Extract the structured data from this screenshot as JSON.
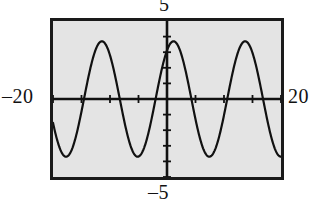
{
  "figure": {
    "kind": "graphing-calculator-screen",
    "screen_background": "#e4e4e4",
    "frame_color": "#1a1a1a",
    "ink_color": "#111111"
  },
  "labels": {
    "top": "5",
    "bottom": "–5",
    "left": "–20",
    "right": "20"
  },
  "chart_data": {
    "type": "line",
    "title": "",
    "subtitle": "",
    "xlabel": "",
    "ylabel": "",
    "grid": false,
    "legend": null,
    "legend_position": "none",
    "xlim": [
      -20,
      20
    ],
    "ylim": [
      -5,
      5
    ],
    "x_tick_labels": [
      "–20",
      "20"
    ],
    "y_tick_labels": [
      "–5",
      "5"
    ],
    "x_ticks": [
      -20,
      -15,
      -10,
      -5,
      0,
      5,
      10,
      15,
      20
    ],
    "y_ticks": [
      -5,
      -4,
      -3,
      -2,
      -1,
      0,
      1,
      2,
      3,
      4
    ],
    "x_axis_position": 0,
    "y_axis_position": 0,
    "series": [
      {
        "name": "y = 3.7 sin(0.5 x + 1.0)",
        "amplitude": 3.7,
        "angular_frequency": 0.5,
        "phase": 1.0,
        "vertical_shift": 0,
        "period": 12.57,
        "stroke": "#111111",
        "x": [
          -20.0,
          -19.0,
          -18.0,
          -17.0,
          -16.0,
          -15.0,
          -14.0,
          -13.0,
          -12.0,
          -11.0,
          -10.0,
          -9.0,
          -8.0,
          -7.0,
          -6.0,
          -5.0,
          -4.0,
          -3.0,
          -2.0,
          -1.0,
          0.0,
          1.0,
          2.0,
          3.0,
          4.0,
          5.0,
          6.0,
          7.0,
          8.0,
          9.0,
          10.0,
          11.0,
          12.0,
          13.0,
          14.0,
          15.0,
          16.0,
          17.0,
          18.0,
          19.0,
          20.0
        ],
        "y": [
          3.33,
          3.69,
          3.56,
          2.95,
          1.96,
          0.71,
          -0.63,
          -1.9,
          -2.92,
          -3.56,
          -3.7,
          -3.34,
          -2.51,
          -1.33,
          0.05,
          1.41,
          2.56,
          3.35,
          3.69,
          3.54,
          2.93,
          1.93,
          0.67,
          -0.67,
          -1.93,
          -2.93,
          -3.54,
          -3.69,
          -3.35,
          -2.56,
          -1.41,
          -0.05,
          1.33,
          2.51,
          3.34,
          3.7,
          3.56,
          2.92,
          1.9,
          0.63,
          -0.71
        ]
      }
    ]
  }
}
